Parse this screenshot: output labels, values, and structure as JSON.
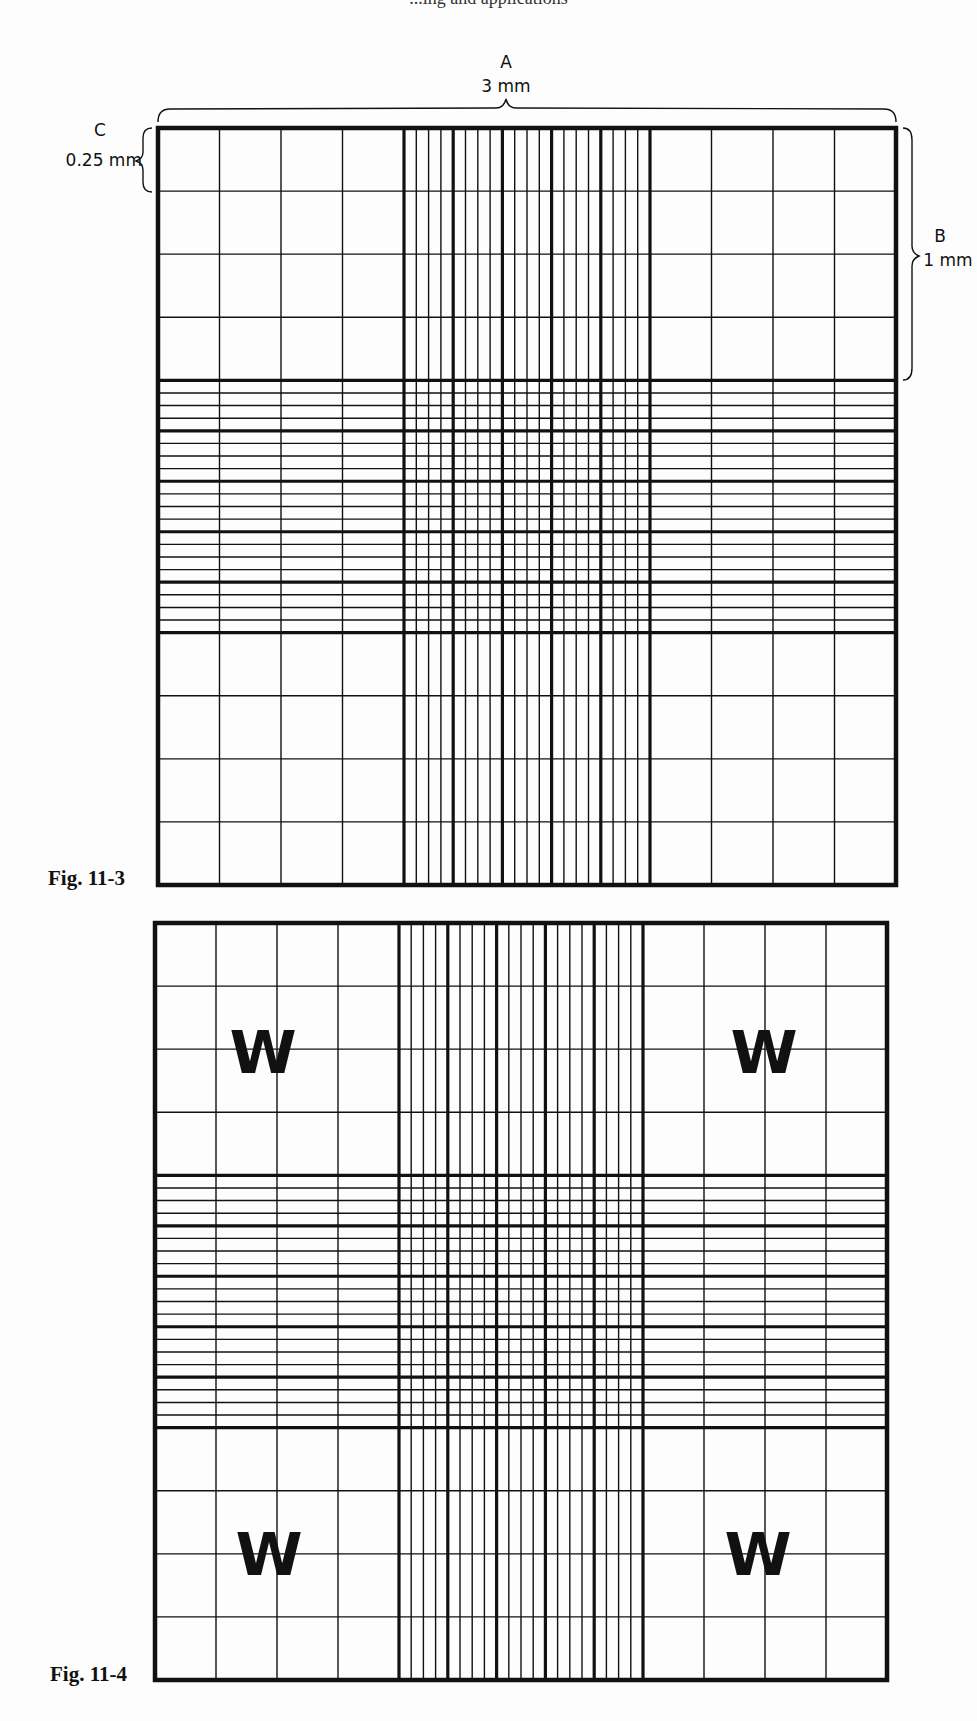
{
  "page": {
    "header_fragment": "...ing and applications"
  },
  "figures": [
    {
      "id": "fig-11-3",
      "caption": "Fig. 11-3",
      "annotations": {
        "A": {
          "letter": "A",
          "measure": "3 mm"
        },
        "B": {
          "letter": "B",
          "measure": "1 mm"
        },
        "C": {
          "letter": "C",
          "measure": "0.25 mm"
        }
      },
      "grid": {
        "outer_cols": 12,
        "center_groups": 5,
        "subdivisions_per_group": 4
      }
    },
    {
      "id": "fig-11-4",
      "caption": "Fig. 11-4",
      "corner_labels": [
        "W",
        "W",
        "W",
        "W"
      ],
      "grid": {
        "outer_cols": 12,
        "center_groups": 5,
        "subdivisions_per_group": 4
      }
    }
  ],
  "colors": {
    "line": "#111111",
    "background": "#fdfdfd"
  }
}
